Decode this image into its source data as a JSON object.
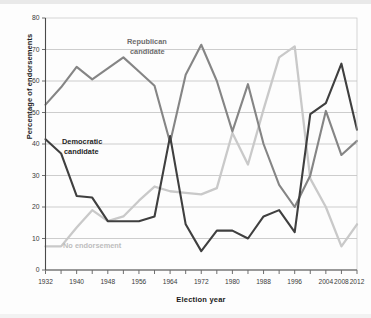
{
  "chart_data": {
    "type": "line",
    "title": "",
    "xlabel": "Election year",
    "ylabel": "Percentage of endorsements",
    "xlim": [
      1932,
      2012
    ],
    "ylim": [
      0,
      80
    ],
    "grid": true,
    "legend_position": "inline-annotations",
    "xtick_labels": [
      "1932",
      "1940",
      "1948",
      "1956",
      "1964",
      "1972",
      "1980",
      "1988",
      "1996",
      "2004",
      "2008",
      "2012"
    ],
    "xtick_values": [
      1932,
      1940,
      1948,
      1956,
      1964,
      1972,
      1980,
      1988,
      1996,
      2004,
      2008,
      2012
    ],
    "ytick_labels": [
      "0",
      "10",
      "20",
      "30",
      "40",
      "50",
      "60",
      "70",
      "80"
    ],
    "ytick_values": [
      0,
      10,
      20,
      30,
      40,
      50,
      60,
      70,
      80
    ],
    "x": [
      1932,
      1936,
      1940,
      1944,
      1948,
      1952,
      1956,
      1960,
      1964,
      1968,
      1972,
      1976,
      1980,
      1984,
      1988,
      1992,
      1996,
      2000,
      2004,
      2008,
      2012
    ],
    "series": [
      {
        "name": "Democratic candidate",
        "color": "#3f3f3f",
        "values": [
          41.5,
          37.0,
          23.5,
          23.0,
          15.5,
          15.5,
          15.5,
          17.0,
          42.5,
          14.5,
          6.0,
          12.5,
          12.5,
          10.0,
          17.0,
          19.0,
          12.0,
          49.5,
          53.0,
          65.5,
          44.5
        ]
      },
      {
        "name": "Republican candidate",
        "color": "#858585",
        "values": [
          52.5,
          58.0,
          64.5,
          60.5,
          64.0,
          67.5,
          63.0,
          58.5,
          40.5,
          62.0,
          71.5,
          60.0,
          44.0,
          59.0,
          40.0,
          27.0,
          20.0,
          30.0,
          50.5,
          36.5,
          41.0
        ]
      },
      {
        "name": "No endorsement",
        "color": "#c9c9c9",
        "values": [
          7.5,
          7.5,
          13.5,
          19.0,
          15.5,
          17.0,
          22.0,
          26.5,
          25.0,
          24.5,
          24.0,
          26.0,
          43.5,
          33.5,
          51.0,
          67.5,
          71.0,
          29.0,
          20.0,
          7.5,
          14.5
        ]
      }
    ],
    "annotations": [
      {
        "text": "Republican",
        "series": "Republican candidate",
        "x": 127,
        "y": 44
      },
      {
        "text": "candidate",
        "series": "Republican candidate",
        "x": 130,
        "y": 54
      },
      {
        "text": "Democratic",
        "series": "Democratic candidate",
        "x": 62,
        "y": 144
      },
      {
        "text": "candidate",
        "series": "Democratic candidate",
        "x": 64,
        "y": 154
      },
      {
        "text": "No endorsement",
        "series": "No endorsement",
        "x": 63,
        "y": 248
      }
    ]
  },
  "axes": {
    "y_axis_title": "Percentage of endorsements",
    "x_axis_title": "Election year"
  },
  "colors": {
    "democratic": "#3f3f3f",
    "republican": "#858585",
    "no_endorsement": "#c9c9c9",
    "grid": "#b8b8b8",
    "axis": "#4a4a4a",
    "background": "#fdfdfd"
  }
}
